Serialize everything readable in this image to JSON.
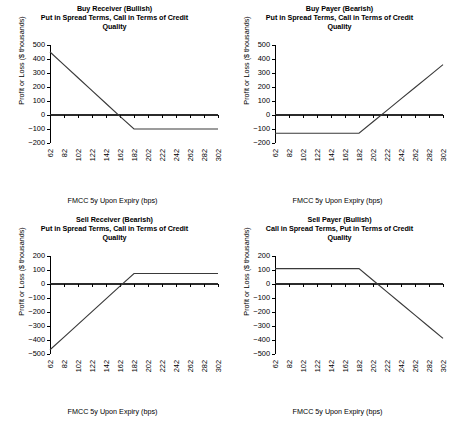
{
  "figure": {
    "axis_x_label": "FMCC 5y Upon Expiry (bps)",
    "axis_y_label": "Profit or Loss ($ thousands)",
    "line_color": "#3a3a3a",
    "axis_color": "#000000",
    "background": "#ffffff"
  },
  "chart_data": [
    {
      "type": "line",
      "panel": "top-left",
      "title": "Buy Receiver (Bullish)",
      "subtitle": "Put in Spread Terms, Call in Terms of Credit Quality",
      "title_lines": [
        "Buy Receiver (Bullish)",
        "Put in Spread Terms, Call in Terms of Credit",
        "Quality"
      ],
      "xlabel": "FMCC 5y Upon Expiry (bps)",
      "ylabel": "Profit or Loss ($ thousands)",
      "x": [
        62,
        82,
        102,
        122,
        142,
        162,
        182,
        202,
        222,
        242,
        262,
        282,
        302
      ],
      "xticklabels": [
        "62",
        "82",
        "102",
        "122",
        "142",
        "162",
        "182",
        "202",
        "222",
        "242",
        "262",
        "282",
        "302"
      ],
      "yticks": [
        -200,
        -100,
        0,
        100,
        200,
        300,
        400,
        500
      ],
      "yticklabels": [
        "-200",
        "-100",
        "0",
        "100",
        "200",
        "300",
        "400",
        "500"
      ],
      "ylim": [
        -200,
        500
      ],
      "xlim": [
        62,
        302
      ],
      "grid": false,
      "legend": "none",
      "series": [
        {
          "name": "Buy Receiver payoff",
          "values": [
            450,
            358,
            266,
            174,
            82,
            -10,
            -100,
            -100,
            -100,
            -100,
            -100,
            -100,
            -100
          ]
        },
        {
          "name": "Zero reference line",
          "values": [
            0,
            0,
            0,
            0,
            0,
            0,
            0,
            0,
            0,
            0,
            0,
            0,
            0
          ]
        }
      ],
      "breakeven_bps": 160,
      "strike_bps": 182,
      "max_loss": -100
    },
    {
      "type": "line",
      "panel": "top-right",
      "title": "Buy Payer (Bearish)",
      "subtitle": "Put in Spread Terms, Call in Terms of Credit Quality",
      "title_lines": [
        "Buy Payer (Bearish)",
        "Put in Spread Terms, Call in Terms of Credit",
        "Quality"
      ],
      "xlabel": "FMCC 5y Upon Expiry (bps)",
      "ylabel": "Profit or Loss ($ thousands)",
      "x": [
        62,
        82,
        102,
        122,
        142,
        162,
        182,
        202,
        222,
        242,
        262,
        282,
        302
      ],
      "xticklabels": [
        "62",
        "82",
        "102",
        "122",
        "142",
        "162",
        "182",
        "202",
        "222",
        "242",
        "262",
        "282",
        "302"
      ],
      "yticks": [
        -200,
        -100,
        0,
        100,
        200,
        300,
        400,
        500
      ],
      "yticklabels": [
        "-200",
        "-100",
        "0",
        "100",
        "200",
        "300",
        "400",
        "500"
      ],
      "ylim": [
        -200,
        500
      ],
      "xlim": [
        62,
        302
      ],
      "grid": false,
      "legend": "none",
      "series": [
        {
          "name": "Buy Payer payoff",
          "values": [
            -130,
            -130,
            -130,
            -130,
            -130,
            -130,
            -130,
            -48,
            33,
            115,
            196,
            278,
            360
          ]
        },
        {
          "name": "Zero reference line",
          "values": [
            0,
            0,
            0,
            0,
            0,
            0,
            0,
            0,
            0,
            0,
            0,
            0,
            0
          ]
        }
      ],
      "breakeven_bps": 214,
      "strike_bps": 182,
      "max_loss": -130
    },
    {
      "type": "line",
      "panel": "bottom-left",
      "title": "Sell Receiver (Bearish)",
      "subtitle": "Put in Spread Terms, Call in Terms of Credit Quality",
      "title_lines": [
        "Sell Receiver (Bearish)",
        "Put in Spread Terms, Call in Terms of Credit",
        "Quality"
      ],
      "xlabel": "FMCC 5y Upon Expiry (bps)",
      "ylabel": "Profit or Loss ($ thousands)",
      "x": [
        62,
        82,
        102,
        122,
        142,
        162,
        182,
        202,
        222,
        242,
        262,
        282,
        302
      ],
      "xticklabels": [
        "62",
        "82",
        "102",
        "122",
        "142",
        "162",
        "182",
        "202",
        "222",
        "242",
        "262",
        "282",
        "302"
      ],
      "yticks": [
        -500,
        -400,
        -300,
        -200,
        -100,
        0,
        100,
        200
      ],
      "yticklabels": [
        "-500",
        "-400",
        "-300",
        "-200",
        "-100",
        "0",
        "100",
        "200"
      ],
      "ylim": [
        -500,
        200
      ],
      "xlim": [
        62,
        302
      ],
      "grid": false,
      "legend": "none",
      "series": [
        {
          "name": "Sell Receiver payoff",
          "values": [
            -470,
            -379,
            -288,
            -197,
            -106,
            -15,
            75,
            75,
            75,
            75,
            75,
            75,
            75
          ]
        },
        {
          "name": "Zero reference line",
          "values": [
            0,
            0,
            0,
            0,
            0,
            0,
            0,
            0,
            0,
            0,
            0,
            0,
            0
          ]
        }
      ],
      "breakeven_bps": 165,
      "strike_bps": 182,
      "max_gain": 75
    },
    {
      "type": "line",
      "panel": "bottom-right",
      "title": "Sell Payer (Bullish)",
      "subtitle": "Call in Spread Terms, Put in Terms of Credit Quality",
      "title_lines": [
        "Sell Payer (Bullish)",
        "Call in Spread Terms, Put in Terms of Credit",
        "Quality"
      ],
      "xlabel": "FMCC 5y Upon Expiry (bps)",
      "ylabel": "Profit or Loss ($ thousands)",
      "x": [
        62,
        82,
        102,
        122,
        142,
        162,
        182,
        202,
        222,
        242,
        262,
        282,
        302
      ],
      "xticklabels": [
        "62",
        "82",
        "102",
        "122",
        "142",
        "162",
        "182",
        "202",
        "222",
        "242",
        "262",
        "282",
        "302"
      ],
      "yticks": [
        -500,
        -400,
        -300,
        -200,
        -100,
        0,
        100,
        200
      ],
      "yticklabels": [
        "-500",
        "-400",
        "-300",
        "-200",
        "-100",
        "0",
        "100",
        "200"
      ],
      "ylim": [
        -500,
        200
      ],
      "xlim": [
        62,
        302
      ],
      "grid": false,
      "legend": "none",
      "series": [
        {
          "name": "Sell Payer payoff",
          "values": [
            110,
            110,
            110,
            110,
            110,
            110,
            110,
            27,
            -56,
            -139,
            -222,
            -305,
            -388
          ]
        },
        {
          "name": "Zero reference line",
          "values": [
            0,
            0,
            0,
            0,
            0,
            0,
            0,
            0,
            0,
            0,
            0,
            0,
            0
          ]
        }
      ],
      "breakeven_bps": 208,
      "strike_bps": 182,
      "max_gain": 110
    }
  ]
}
